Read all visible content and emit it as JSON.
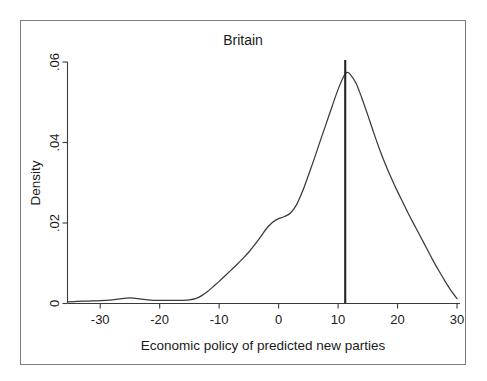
{
  "chart_data": {
    "type": "line",
    "title": "Britain",
    "xlabel": "Economic policy of predicted new parties",
    "ylabel": "Density",
    "xlim": [
      -35.5,
      30.5
    ],
    "ylim": [
      0,
      0.0615
    ],
    "xticks": [
      -30,
      -20,
      -10,
      0,
      10,
      20,
      30
    ],
    "xtick_labels": [
      "-30",
      "-20",
      "-10",
      "0",
      "10",
      "20",
      "30"
    ],
    "yticks": [
      0,
      0.02,
      0.04,
      0.06
    ],
    "ytick_labels": [
      "0",
      ".02",
      ".04",
      ".06"
    ],
    "grid": false,
    "legend": null,
    "series": [
      {
        "name": "Kernel density of predicted new party economic policy",
        "x": [
          -35.5,
          -34,
          -32,
          -30,
          -28,
          -27,
          -26,
          -25,
          -24,
          -23,
          -22,
          -21,
          -20,
          -19,
          -18,
          -17,
          -16,
          -15,
          -14,
          -13,
          -12,
          -11,
          -10,
          -9,
          -8,
          -7,
          -6,
          -5,
          -4,
          -3,
          -2,
          -1,
          0,
          1,
          2,
          3,
          4,
          5,
          6,
          7,
          8,
          9,
          10,
          11,
          11.5,
          12,
          13,
          14,
          15,
          16,
          17,
          18,
          19,
          20,
          21,
          22,
          23,
          24,
          25,
          26,
          27,
          28,
          29,
          30
        ],
        "y": [
          0.0004,
          0.0005,
          0.0006,
          0.0007,
          0.0009,
          0.0011,
          0.0013,
          0.0014,
          0.0013,
          0.0011,
          0.0009,
          0.0008,
          0.0008,
          0.0008,
          0.0008,
          0.0008,
          0.0008,
          0.0009,
          0.0012,
          0.0019,
          0.0029,
          0.0042,
          0.0055,
          0.0069,
          0.0083,
          0.0097,
          0.0112,
          0.0128,
          0.0146,
          0.0166,
          0.0187,
          0.0202,
          0.0211,
          0.0216,
          0.0225,
          0.0245,
          0.0278,
          0.0318,
          0.036,
          0.0404,
          0.0447,
          0.049,
          0.0532,
          0.0566,
          0.0574,
          0.057,
          0.0548,
          0.051,
          0.0468,
          0.0424,
          0.0382,
          0.0344,
          0.031,
          0.0278,
          0.0248,
          0.0218,
          0.019,
          0.0162,
          0.0134,
          0.0106,
          0.008,
          0.0055,
          0.0032,
          0.0012
        ]
      }
    ],
    "annotations": [
      {
        "name": "reference-line",
        "type": "vline",
        "x": 11.2,
        "y_top": 0.0605,
        "label": ""
      }
    ]
  }
}
